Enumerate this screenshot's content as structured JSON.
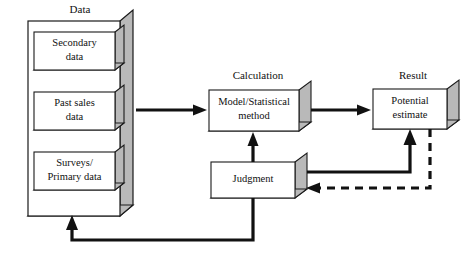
{
  "diagram": {
    "background_color": "#ffffff",
    "line_color": "#111111",
    "box_face_color": "#ffffff",
    "box_shade_color": "#b9b9b9",
    "groups": [
      {
        "id": "data",
        "label": "Data"
      },
      {
        "id": "calculation",
        "label": "Calculation"
      },
      {
        "id": "result",
        "label": "Result"
      }
    ],
    "boxes": [
      {
        "id": "secondary-data",
        "line1": "Secondary",
        "line2": "data"
      },
      {
        "id": "past-sales-data",
        "line1": "Past sales",
        "line2": "data"
      },
      {
        "id": "surveys-primary-data",
        "line1": "Surveys/",
        "line2": "Primary data"
      },
      {
        "id": "model-statistical-method",
        "line1": "Model/Statistical",
        "line2": "method"
      },
      {
        "id": "potential-estimate",
        "line1": "Potential",
        "line2": "estimate"
      },
      {
        "id": "judgment",
        "line1": "Judgment",
        "line2": ""
      }
    ],
    "connectors": [
      {
        "id": "data-to-calculation",
        "style": "solid",
        "from": "data",
        "to": "model-statistical-method"
      },
      {
        "id": "calculation-to-result",
        "style": "solid",
        "from": "model-statistical-method",
        "to": "potential-estimate"
      },
      {
        "id": "judgment-to-calculation",
        "style": "solid",
        "from": "judgment",
        "to": "model-statistical-method"
      },
      {
        "id": "judgment-to-result",
        "style": "solid",
        "from": "judgment",
        "to": "potential-estimate"
      },
      {
        "id": "result-to-judgment-feedback",
        "style": "dashed",
        "from": "potential-estimate",
        "to": "judgment"
      },
      {
        "id": "judgment-to-data-feedback",
        "style": "solid",
        "from": "judgment",
        "to": "data"
      }
    ]
  }
}
